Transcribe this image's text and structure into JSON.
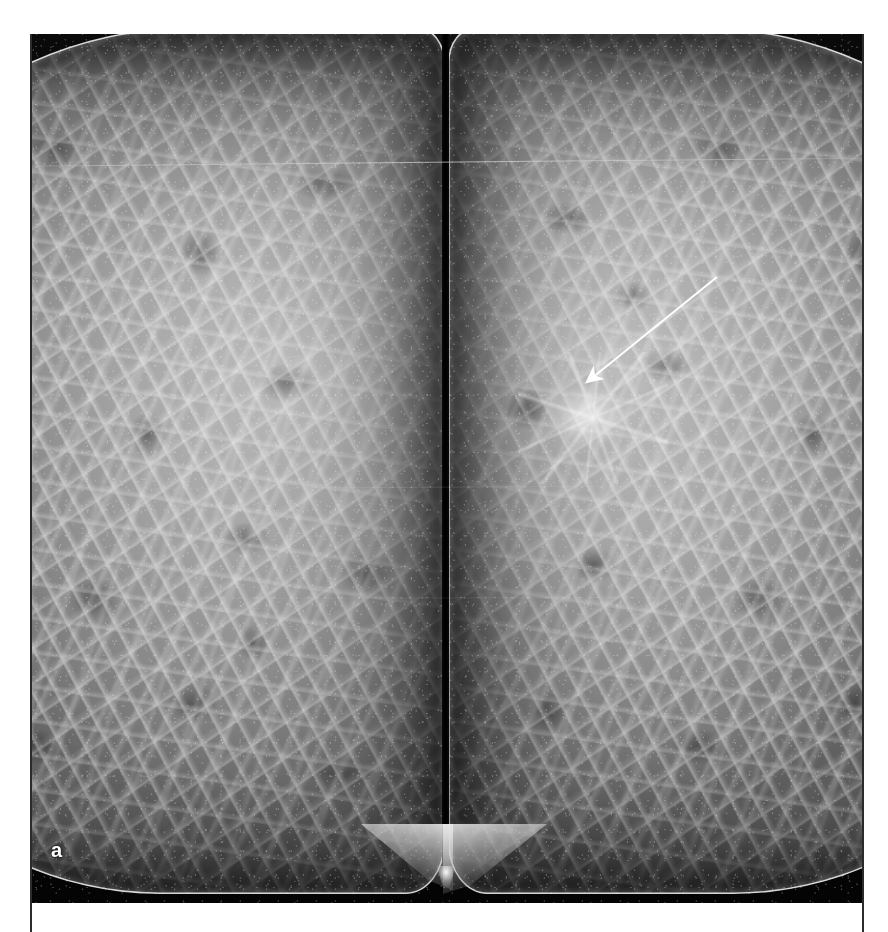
{
  "figure": {
    "panel_label": "a",
    "modality": "mammogram",
    "view": "bilateral craniocaudal (CC)",
    "caption": ""
  },
  "plate": {
    "background_color": "#060606",
    "tissue_color": "#9a9a9a",
    "skinline_color": "#ffffff",
    "label_color": "#ffffff"
  },
  "panels": [
    {
      "id": "left-breast",
      "name": "left-breast-cc",
      "side": "left",
      "tissue_density": "scattered fibroglandular",
      "findings": "no focal lesion"
    },
    {
      "id": "right-breast",
      "name": "right-breast-cc",
      "side": "right",
      "tissue_density": "scattered fibroglandular",
      "findings": "spiculated mass"
    }
  ],
  "annotations": [
    {
      "id": "lesion-arrow",
      "type": "arrow",
      "color": "#ffffff",
      "tail_x": 686,
      "tail_y": 243,
      "tip_x": 552,
      "tip_y": 351,
      "points_to": "spiculated-mass"
    }
  ],
  "markers": [
    {
      "id": "lesion-marker",
      "type": "region",
      "label": "spiculated-mass",
      "center_x": 556,
      "center_y": 382
    }
  ]
}
